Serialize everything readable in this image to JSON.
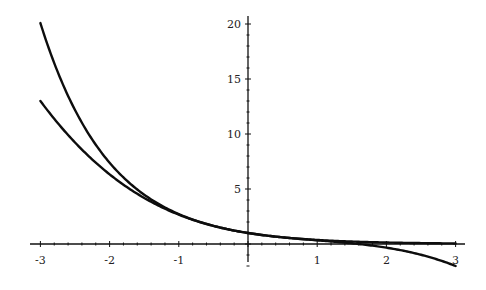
{
  "chart_data": {
    "type": "line",
    "title": "",
    "xlabel": "",
    "ylabel": "",
    "xlim": [
      -3,
      3
    ],
    "ylim": [
      -2.2,
      21
    ],
    "grid": false,
    "legend": null,
    "x_ticks": [
      -3,
      -2,
      -1,
      1,
      2,
      3
    ],
    "x_tick_labels": [
      "-3",
      "-2",
      "-1",
      "1",
      "2",
      "3"
    ],
    "y_ticks": [
      5,
      10,
      15,
      20
    ],
    "y_tick_labels": [
      "5",
      "10",
      "15",
      "20"
    ],
    "series": [
      {
        "name": "exp(-x)",
        "x": [
          -3,
          -2.5,
          -2,
          -1.5,
          -1,
          -0.5,
          0,
          0.5,
          1,
          1.5,
          2,
          2.5,
          3
        ],
        "values": [
          20.09,
          12.18,
          7.39,
          4.48,
          2.72,
          1.65,
          1.0,
          0.61,
          0.37,
          0.22,
          0.14,
          0.08,
          0.05
        ]
      },
      {
        "name": "1 - x + x^2/2 - x^3/6",
        "x": [
          -3,
          -2.5,
          -2,
          -1.5,
          -1,
          -0.5,
          0,
          0.5,
          1,
          1.5,
          2,
          2.5,
          3
        ],
        "values": [
          13.0,
          9.23,
          6.33,
          4.19,
          2.67,
          1.65,
          1.0,
          0.6,
          0.33,
          0.06,
          -0.33,
          -0.98,
          -2.0
        ]
      }
    ]
  },
  "plot": {
    "origin_px": [
      248,
      244
    ],
    "x_unit_px": 69.2,
    "y_unit_px": 11.0,
    "x_axis_px": [
      30,
      465
    ],
    "y_axis_px": [
      16,
      262
    ]
  }
}
